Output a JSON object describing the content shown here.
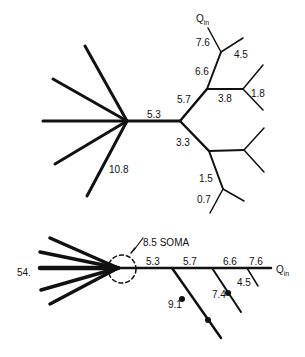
{
  "top_tree": {
    "labels": {
      "q_in": "Q",
      "q_in_sub": "in",
      "l76": "7.6",
      "l45": "4.5",
      "l66": "6.6",
      "l57": "5.7",
      "l38": "3.8",
      "l18": "1.8",
      "l53": "5.3",
      "l33": "3.3",
      "l15": "1.5",
      "l07": "0.7",
      "l108": "10.8"
    }
  },
  "bottom_tree": {
    "labels": {
      "soma": "8.5 SOMA",
      "l54": "54.",
      "l53": "5.3",
      "l57": "5.7",
      "l66": "6.6",
      "l76": "7.6",
      "q_in": "Q",
      "q_in_sub": "in",
      "l91": "9.1",
      "l74": "7.4",
      "l45": "4.5"
    }
  }
}
